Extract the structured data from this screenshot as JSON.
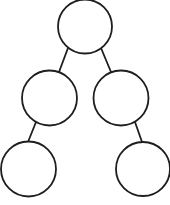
{
  "diagram": {
    "type": "binary-tree",
    "background": "#ffffff",
    "stroke_color": "#1e1e1e",
    "stroke_width": 1.8,
    "node_fill": "#ffffff",
    "nodes": [
      {
        "id": "root",
        "label": "",
        "cx": 85,
        "cy": 26.5,
        "r": 27
      },
      {
        "id": "left-child",
        "label": "",
        "cx": 49.5,
        "cy": 98,
        "r": 27.5
      },
      {
        "id": "right-child",
        "label": "",
        "cx": 121,
        "cy": 98,
        "r": 27.5
      },
      {
        "id": "left-left-grandchild",
        "label": "",
        "cx": 28.5,
        "cy": 169,
        "r": 27.5
      },
      {
        "id": "right-right-grandchild",
        "label": "",
        "cx": 143,
        "cy": 169,
        "r": 27
      }
    ],
    "edges": [
      {
        "from": "root",
        "to": "left-child",
        "x1": 68,
        "y1": 48,
        "x2": 59,
        "y2": 72
      },
      {
        "from": "root",
        "to": "right-child",
        "x1": 101,
        "y1": 48,
        "x2": 111,
        "y2": 72
      },
      {
        "from": "left-child",
        "to": "left-left-grandchild",
        "x1": 36,
        "y1": 122,
        "x2": 28,
        "y2": 142
      },
      {
        "from": "right-child",
        "to": "right-right-grandchild",
        "x1": 135,
        "y1": 122,
        "x2": 142,
        "y2": 142
      }
    ]
  }
}
